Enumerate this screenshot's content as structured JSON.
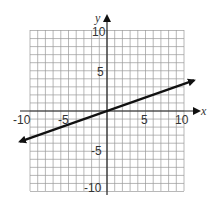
{
  "chart_data": {
    "type": "line",
    "title": "",
    "xlabel": "x",
    "ylabel": "y",
    "xlim": [
      -10,
      10
    ],
    "ylim": [
      -10,
      10
    ],
    "grid": true,
    "grid_step": 1,
    "x_ticks": [
      "-10",
      "-5",
      "5",
      "10"
    ],
    "y_ticks": [
      "10",
      "5",
      "-5",
      "-10"
    ],
    "series": [
      {
        "name": "line",
        "equation": "y = x/3",
        "slope": 0.333,
        "intercept": 0,
        "arrows": "both",
        "x": [
          -11.3,
          -6,
          -3,
          0,
          3,
          6,
          11.3
        ],
        "y": [
          -3.8,
          -2,
          -1,
          0,
          1,
          2,
          3.8
        ]
      }
    ]
  },
  "labels": {
    "x_axis": "x",
    "y_axis": "y",
    "x_neg10": "-10",
    "x_neg5": "-5",
    "x_pos5": "5",
    "x_pos10": "10",
    "y_pos10": "10",
    "y_pos5": "5",
    "y_neg5": "-5",
    "y_neg10": "-10"
  },
  "colors": {
    "grid": "#9a9a9a",
    "axis": "#222222",
    "line": "#111111"
  }
}
